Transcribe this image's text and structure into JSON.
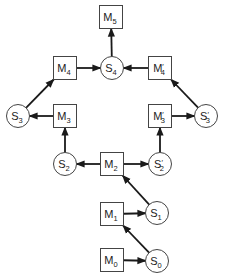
{
  "diagram": {
    "nodes": [
      {
        "id": "M5",
        "shape": "box",
        "base": "M",
        "sub": "5",
        "prime": false
      },
      {
        "id": "S4",
        "shape": "circle",
        "base": "S",
        "sub": "4",
        "prime": false
      },
      {
        "id": "M4",
        "shape": "box",
        "base": "M",
        "sub": "4",
        "prime": false
      },
      {
        "id": "M4p",
        "shape": "box",
        "base": "M",
        "sub": "4",
        "prime": true
      },
      {
        "id": "S3",
        "shape": "circle",
        "base": "S",
        "sub": "3",
        "prime": false
      },
      {
        "id": "M3",
        "shape": "box",
        "base": "M",
        "sub": "3",
        "prime": false
      },
      {
        "id": "M3p",
        "shape": "box",
        "base": "M",
        "sub": "3",
        "prime": true
      },
      {
        "id": "S3p",
        "shape": "circle",
        "base": "S",
        "sub": "3",
        "prime": true
      },
      {
        "id": "S2",
        "shape": "circle",
        "base": "S",
        "sub": "2",
        "prime": false
      },
      {
        "id": "M2",
        "shape": "box",
        "base": "M",
        "sub": "2",
        "prime": false
      },
      {
        "id": "S2p",
        "shape": "circle",
        "base": "S",
        "sub": "2",
        "prime": true
      },
      {
        "id": "M1",
        "shape": "box",
        "base": "M",
        "sub": "1",
        "prime": false
      },
      {
        "id": "S1",
        "shape": "circle",
        "base": "S",
        "sub": "1",
        "prime": false
      },
      {
        "id": "M0",
        "shape": "box",
        "base": "M",
        "sub": "0",
        "prime": false
      },
      {
        "id": "S0",
        "shape": "circle",
        "base": "S",
        "sub": "0",
        "prime": false
      }
    ],
    "edges": [
      {
        "from": "M0",
        "to": "S0"
      },
      {
        "from": "S0",
        "to": "M1"
      },
      {
        "from": "M1",
        "to": "S1"
      },
      {
        "from": "S1",
        "to": "M2"
      },
      {
        "from": "M2",
        "to": "S2"
      },
      {
        "from": "M2",
        "to": "S2p"
      },
      {
        "from": "S2",
        "to": "M3"
      },
      {
        "from": "S2p",
        "to": "M3p"
      },
      {
        "from": "M3",
        "to": "S3"
      },
      {
        "from": "M3p",
        "to": "S3p"
      },
      {
        "from": "S3",
        "to": "M4"
      },
      {
        "from": "S3p",
        "to": "M4p"
      },
      {
        "from": "M4",
        "to": "S4"
      },
      {
        "from": "M4p",
        "to": "S4"
      },
      {
        "from": "S4",
        "to": "M5"
      }
    ]
  }
}
